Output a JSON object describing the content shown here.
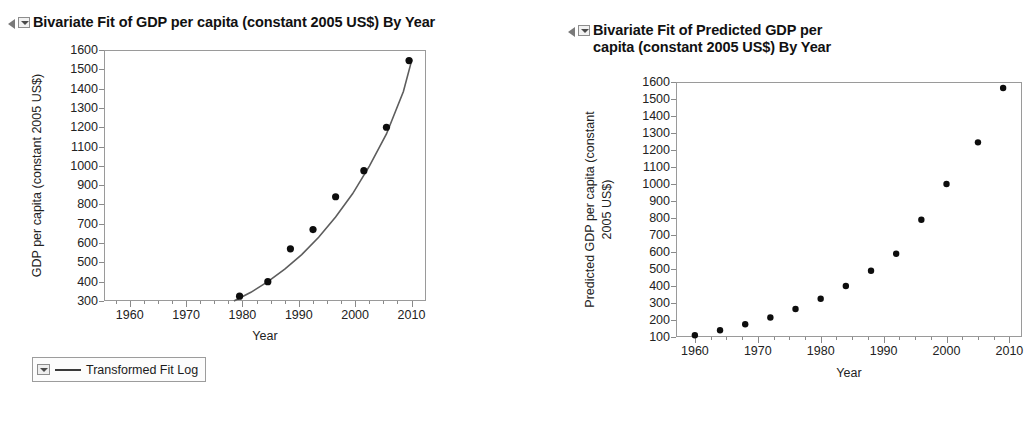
{
  "left_panel": {
    "disclosure_icon": "triangle-right-icon",
    "menu_icon": "context-menu-icon",
    "title": "Bivariate Fit of GDP per capita (constant 2005 US$) By Year",
    "legend": {
      "menu_icon": "context-menu-icon",
      "line_icon": "line-swatch-icon",
      "label": "Transformed Fit Log"
    }
  },
  "right_panel": {
    "disclosure_icon": "triangle-right-icon",
    "menu_icon": "context-menu-icon",
    "title_line1": "Bivariate Fit of Predicted GDP per",
    "title_line2": "capita (constant 2005 US$) By Year"
  },
  "chart_data": [
    {
      "type": "scatter",
      "id": "bivariate-fit-gdp",
      "title": "Bivariate Fit of GDP per capita (constant 2005 US$) By Year",
      "xlabel": "Year",
      "ylabel": "GDP per capita (constant 2005 US$)",
      "xlim": [
        1955,
        2012
      ],
      "ylim": [
        300,
        1600
      ],
      "xticks": [
        1960,
        1970,
        1980,
        1990,
        2000,
        2010
      ],
      "yticks": [
        300,
        400,
        500,
        600,
        700,
        800,
        900,
        1000,
        1100,
        1200,
        1300,
        1400,
        1500,
        1600
      ],
      "grid": false,
      "x": [
        1979,
        1984,
        1988,
        1992,
        1996,
        2001,
        2005,
        2009
      ],
      "y": [
        325,
        400,
        570,
        670,
        840,
        975,
        1200,
        1545
      ],
      "series": [
        {
          "name": "Transformed Fit Log",
          "type": "line",
          "x": [
            1978,
            1981,
            1984,
            1987,
            1990,
            1993,
            1996,
            1999,
            2002,
            2005,
            2008,
            2009.5
          ],
          "y": [
            300,
            345,
            400,
            465,
            540,
            630,
            735,
            855,
            1000,
            1165,
            1385,
            1550
          ]
        }
      ],
      "legend_entries": [
        "Transformed Fit Log"
      ],
      "legend_position": "below-left"
    },
    {
      "type": "scatter",
      "id": "bivariate-fit-predicted-gdp",
      "title": "Bivariate Fit of Predicted GDP per capita (constant 2005 US$) By Year",
      "xlabel": "Year",
      "ylabel": "Predicted GDP per capita (constant 2005 US$)",
      "xlim": [
        1957,
        2012
      ],
      "ylim": [
        100,
        1600
      ],
      "xticks": [
        1960,
        1970,
        1980,
        1990,
        2000,
        2010
      ],
      "yticks": [
        100,
        200,
        300,
        400,
        500,
        600,
        700,
        800,
        900,
        1000,
        1100,
        1200,
        1300,
        1400,
        1500,
        1600
      ],
      "grid": false,
      "x": [
        1960,
        1964,
        1968,
        1972,
        1976,
        1980,
        1984,
        1988,
        1992,
        1996,
        2000,
        2005,
        2009
      ],
      "y": [
        110,
        140,
        175,
        215,
        265,
        325,
        400,
        490,
        590,
        790,
        1000,
        1245,
        1565
      ]
    }
  ]
}
